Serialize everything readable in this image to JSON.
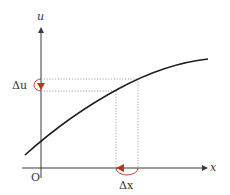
{
  "diagram": {
    "axes": {
      "x_label": "x",
      "y_label": "u",
      "origin_label": "O"
    },
    "annotations": {
      "delta_u": "Δu",
      "delta_x": "Δx"
    },
    "colors": {
      "axis": "#3a3a3a",
      "curve": "#1e1e1e",
      "dotted": "#8a8a8a",
      "arrow_accent": "#b5361f"
    }
  }
}
